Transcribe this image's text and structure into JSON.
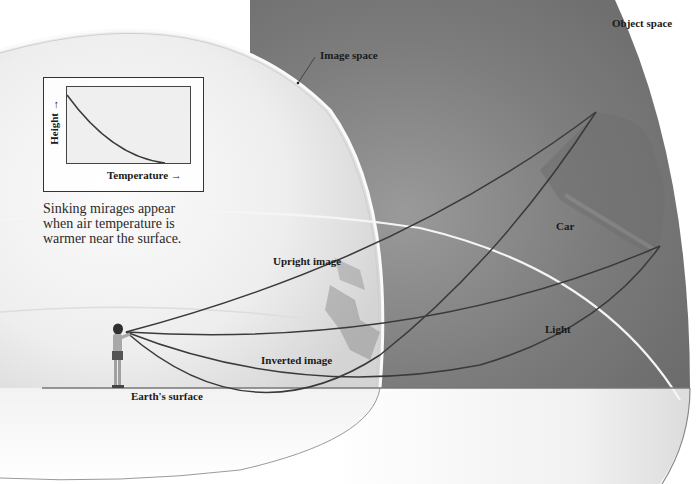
{
  "figure": {
    "labels": {
      "object_space": "Object space",
      "image_space": "Image space",
      "car": "Car",
      "upright_image": "Upright image",
      "inverted_image": "Inverted image",
      "light": "Light",
      "earths_surface": "Earth's surface"
    },
    "caption": [
      "Sinking mirages appear",
      "when air temperature is",
      "warmer near the surface."
    ],
    "inset_graph": {
      "xlabel": "Temperature →",
      "ylabel": "Height →",
      "curve": "height decreases as temperature increases (concave-up decay)"
    },
    "icons": {
      "observer": "person-icon",
      "object": "car-icon"
    },
    "colors": {
      "object_space": "#7a7a7a",
      "image_space": "#e9e9e9",
      "rays": "#3a3a3a",
      "boundary": "#f4f4f4",
      "ground": "#666666"
    }
  }
}
